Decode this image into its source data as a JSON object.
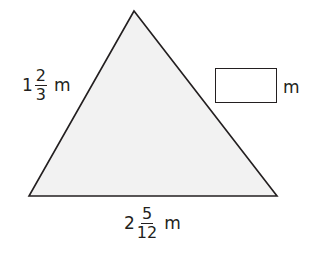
{
  "figure": {
    "shape": "triangle",
    "fill_color": "#f2f2f2",
    "stroke_color": "#231f20",
    "vertices": [
      [
        134,
        11
      ],
      [
        29,
        196
      ],
      [
        277,
        196
      ]
    ]
  },
  "side_label": {
    "whole": "1",
    "numerator": "2",
    "denominator": "3",
    "unit": "m"
  },
  "base_label": {
    "whole": "2",
    "numerator": "5",
    "denominator": "12",
    "unit": "m"
  },
  "answer": {
    "value": "",
    "unit": "m"
  }
}
